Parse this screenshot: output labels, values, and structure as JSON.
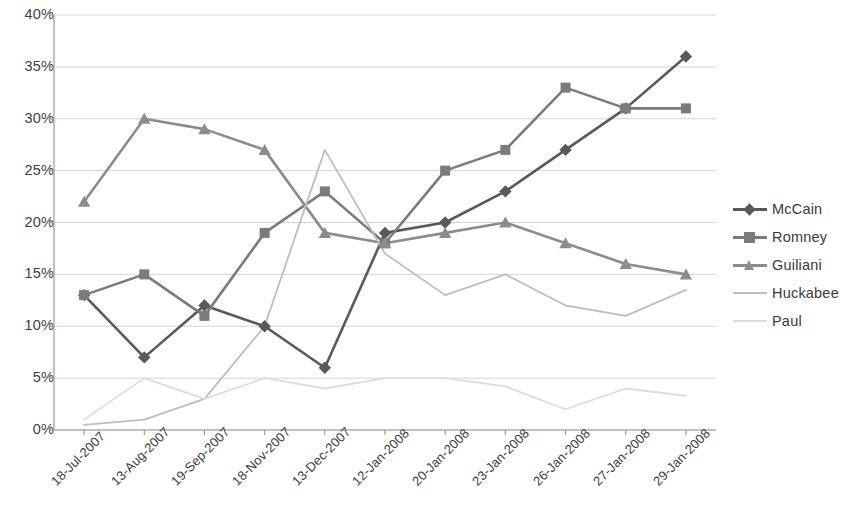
{
  "chart_data": {
    "type": "line",
    "title": "",
    "xlabel": "",
    "ylabel": "",
    "ylim": [
      0,
      40
    ],
    "ytick_labels": [
      "0%",
      "5%",
      "10%",
      "15%",
      "20%",
      "25%",
      "30%",
      "35%",
      "40%"
    ],
    "ytick_values": [
      0,
      5,
      10,
      15,
      20,
      25,
      30,
      35,
      40
    ],
    "grid": true,
    "legend_position": "right",
    "categories": [
      "18-Jul-2007",
      "13-Aug-2007",
      "19-Sep-2007",
      "18-Nov-2007",
      "13-Dec-2007",
      "12-Jan-2008",
      "20-Jan-2008",
      "23-Jan-2008",
      "26-Jan-2008",
      "27-Jan-2008",
      "29-Jan-2008"
    ],
    "series": [
      {
        "name": "McCain",
        "color": "#595959",
        "marker": "diamond",
        "values": [
          13,
          7,
          12,
          10,
          6,
          19,
          20,
          23,
          27,
          31,
          36
        ]
      },
      {
        "name": "Romney",
        "color": "#7b7b7b",
        "marker": "square",
        "values": [
          13,
          15,
          11,
          19,
          23,
          18,
          25,
          27,
          33,
          31,
          31
        ]
      },
      {
        "name": "Guiliani",
        "color": "#8c8c8c",
        "marker": "triangle",
        "values": [
          22,
          30,
          29,
          27,
          19,
          18,
          19,
          20,
          18,
          16,
          15
        ]
      },
      {
        "name": "Huckabee",
        "color": "#bdbdbd",
        "marker": "none",
        "values": [
          0.5,
          1,
          3,
          10,
          27,
          17,
          13,
          15,
          12,
          11,
          13.5
        ]
      },
      {
        "name": "Paul",
        "color": "#dcdcdc",
        "marker": "none",
        "values": [
          1,
          5,
          3,
          5,
          4,
          5,
          5,
          4.2,
          2,
          4,
          3.3
        ]
      }
    ]
  },
  "legend": {
    "items": [
      {
        "label": "McCain"
      },
      {
        "label": "Romney"
      },
      {
        "label": "Guiliani"
      },
      {
        "label": "Huckabee"
      },
      {
        "label": "Paul"
      }
    ]
  },
  "axis_colors": {
    "axis_line": "#9a9a9a",
    "gridline": "#d5d5d5"
  }
}
